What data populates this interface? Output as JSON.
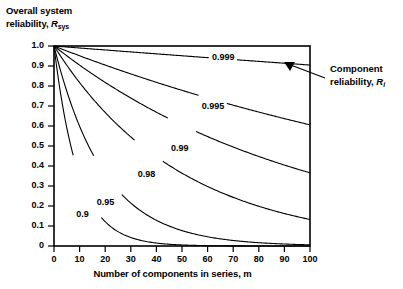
{
  "chart_data": {
    "type": "line",
    "title": "",
    "xlabel": "Number of components in series, m",
    "ylabel_line1": "Overall system",
    "ylabel_line2": "reliability,",
    "ylabel_symbol": "R",
    "ylabel_subscript": "sys",
    "xlabel_symbol": "m",
    "xlim": [
      0,
      100
    ],
    "ylim": [
      0,
      1.0
    ],
    "grid": false,
    "legend_position": "inline-curve-labels",
    "x_ticks": [
      0,
      10,
      20,
      30,
      40,
      50,
      60,
      70,
      80,
      90,
      100
    ],
    "x_tick_labels": [
      "0",
      "10",
      "20",
      "30",
      "40",
      "50",
      "60",
      "70",
      "80",
      "90",
      "100"
    ],
    "y_ticks": [
      0,
      0.1,
      0.2,
      0.3,
      0.4,
      0.5,
      0.6,
      0.7,
      0.8,
      0.9,
      1.0
    ],
    "y_tick_labels": [
      "0",
      "0.1",
      "0.2",
      "0.3",
      "0.4",
      "0.5",
      "0.6",
      "0.7",
      "0.8",
      "0.9",
      "1.0"
    ],
    "relation": "R_sys = R_i^m",
    "series": [
      {
        "name": "0.999",
        "component_reliability": 0.999,
        "label_x": 66,
        "label_y": 0.94,
        "x": [
          0,
          10,
          20,
          30,
          40,
          50,
          60,
          70,
          80,
          90,
          100
        ],
        "values": [
          1.0,
          0.99,
          0.98,
          0.97,
          0.961,
          0.951,
          0.942,
          0.932,
          0.923,
          0.914,
          0.905
        ]
      },
      {
        "name": "0.995",
        "component_reliability": 0.995,
        "label_x": 62,
        "label_y": 0.695,
        "x": [
          0,
          10,
          20,
          30,
          40,
          50,
          60,
          70,
          80,
          90,
          100
        ],
        "values": [
          1.0,
          0.951,
          0.905,
          0.86,
          0.818,
          0.778,
          0.74,
          0.704,
          0.67,
          0.637,
          0.606
        ]
      },
      {
        "name": "0.99",
        "component_reliability": 0.99,
        "label_x": 50,
        "label_y": 0.485,
        "x": [
          0,
          10,
          20,
          30,
          40,
          50,
          60,
          70,
          80,
          90,
          100
        ],
        "values": [
          1.0,
          0.904,
          0.818,
          0.74,
          0.669,
          0.605,
          0.547,
          0.495,
          0.448,
          0.405,
          0.366
        ]
      },
      {
        "name": "0.98",
        "component_reliability": 0.98,
        "label_x": 37,
        "label_y": 0.355,
        "x": [
          0,
          10,
          20,
          30,
          40,
          50,
          60,
          70,
          80,
          90,
          100
        ],
        "values": [
          1.0,
          0.817,
          0.668,
          0.545,
          0.446,
          0.364,
          0.298,
          0.243,
          0.199,
          0.162,
          0.133
        ]
      },
      {
        "name": "0.95",
        "component_reliability": 0.95,
        "label_x": 21,
        "label_y": 0.215,
        "x": [
          0,
          10,
          20,
          30,
          40,
          50,
          60,
          70,
          80,
          90,
          100
        ],
        "values": [
          1.0,
          0.599,
          0.358,
          0.215,
          0.129,
          0.077,
          0.046,
          0.028,
          0.017,
          0.01,
          0.006
        ]
      },
      {
        "name": "0.9",
        "component_reliability": 0.9,
        "label_x": 13,
        "label_y": 0.155,
        "x": [
          0,
          10,
          20,
          30,
          40,
          50,
          60,
          70,
          80,
          90,
          100
        ],
        "values": [
          1.0,
          0.349,
          0.122,
          0.042,
          0.015,
          0.005,
          0.002,
          0.001,
          0.0,
          0.0,
          0.0
        ]
      }
    ],
    "annotations": [
      {
        "name": "component-reliability-callout",
        "line1": "Component",
        "line2": "reliability,",
        "symbol": "R",
        "subscript": "i",
        "points_to_series": "0.999"
      }
    ]
  }
}
